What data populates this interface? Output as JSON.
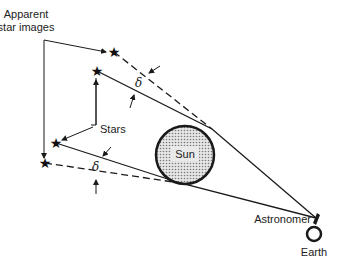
{
  "diagram": {
    "labels": {
      "apparent_line1": "Apparent",
      "apparent_line2": "star images",
      "stars": "Stars",
      "sun": "Sun",
      "astronomer": "Astronomer",
      "earth": "Earth",
      "delta_top": "δ",
      "delta_bottom": "δ"
    },
    "colors": {
      "line": "#1a1a1a",
      "sun_fill": "#bdbdbd",
      "background": "#ffffff"
    },
    "icons": {
      "star": "★"
    }
  }
}
